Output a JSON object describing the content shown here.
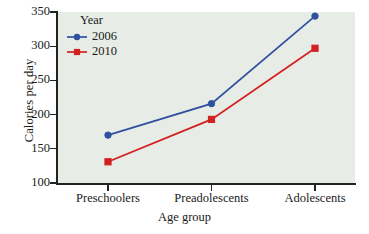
{
  "chart_data": {
    "type": "line",
    "title": "",
    "xlabel": "Age group",
    "ylabel": "Calories per day",
    "categories": [
      "Preschoolers",
      "Preadolescents",
      "Adolescents"
    ],
    "ylim": [
      100,
      350
    ],
    "yticks": [
      100,
      150,
      200,
      250,
      300,
      350
    ],
    "grid": false,
    "legend_position": "top-left",
    "legend_title": "Year",
    "series": [
      {
        "name": "2006",
        "values": [
          170,
          216,
          344
        ],
        "color": "#2f4f9f",
        "marker": "circle"
      },
      {
        "name": "2010",
        "values": [
          131,
          193,
          297
        ],
        "color": "#d32020",
        "marker": "square"
      }
    ],
    "plot_background": "#e7ece6",
    "axis_color": "#23231f"
  }
}
